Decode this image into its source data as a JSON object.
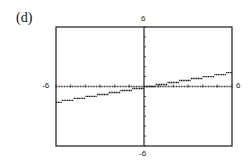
{
  "panel": {
    "label": "(d)"
  },
  "axes": {
    "x_min_label": "-6",
    "x_max_label": "6",
    "y_min_label": "-6",
    "y_max_label": "6"
  },
  "colors": {
    "frame": "#1a1a1a",
    "axis": "#333333",
    "curve": "#111111"
  },
  "chart_data": {
    "type": "line",
    "title": "(d)",
    "xlabel": "",
    "ylabel": "",
    "xlim": [
      -6,
      6
    ],
    "ylim": [
      -6,
      6
    ],
    "grid": false,
    "x_ticks": [
      -6,
      -5,
      -4,
      -3,
      -2,
      -1,
      0,
      1,
      2,
      3,
      4,
      5,
      6
    ],
    "y_ticks": [
      -6,
      -5,
      -4,
      -3,
      -2,
      -1,
      0,
      1,
      2,
      3,
      4,
      5,
      6
    ],
    "series": [
      {
        "name": "step function",
        "steps": [
          {
            "x0": -6.0,
            "x1": -5.6,
            "y": -1.6
          },
          {
            "x0": -5.6,
            "x1": -4.8,
            "y": -1.4
          },
          {
            "x0": -4.8,
            "x1": -4.0,
            "y": -1.2
          },
          {
            "x0": -4.0,
            "x1": -3.2,
            "y": -1.0
          },
          {
            "x0": -3.2,
            "x1": -2.4,
            "y": -0.8
          },
          {
            "x0": -2.4,
            "x1": -1.6,
            "y": -0.6
          },
          {
            "x0": -1.6,
            "x1": -0.8,
            "y": -0.4
          },
          {
            "x0": -0.8,
            "x1": 0.0,
            "y": -0.2
          },
          {
            "x0": 0.0,
            "x1": 0.8,
            "y": 0.0
          },
          {
            "x0": 0.8,
            "x1": 1.6,
            "y": 0.2
          },
          {
            "x0": 1.6,
            "x1": 2.4,
            "y": 0.4
          },
          {
            "x0": 2.4,
            "x1": 3.2,
            "y": 0.6
          },
          {
            "x0": 3.2,
            "x1": 4.0,
            "y": 0.8
          },
          {
            "x0": 4.0,
            "x1": 4.8,
            "y": 1.0
          },
          {
            "x0": 4.8,
            "x1": 5.6,
            "y": 1.2
          },
          {
            "x0": 5.6,
            "x1": 6.0,
            "y": 1.4
          }
        ]
      }
    ]
  }
}
